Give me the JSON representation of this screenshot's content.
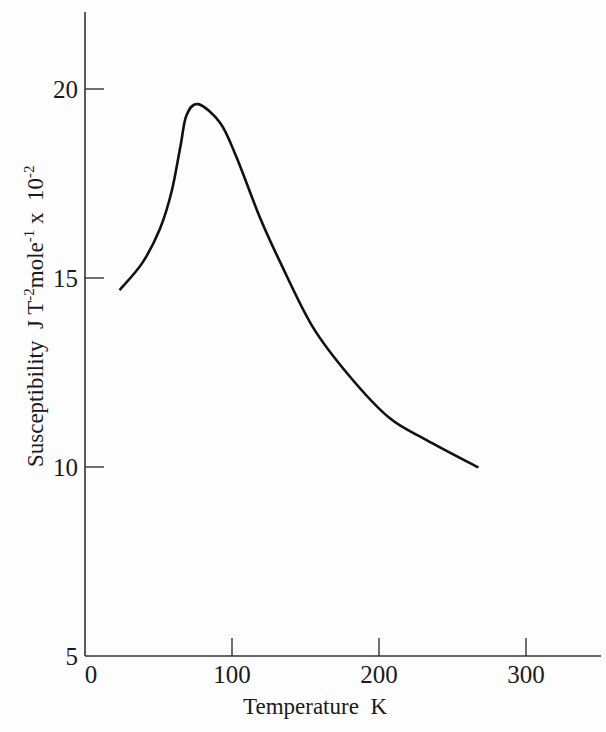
{
  "chart_data": {
    "type": "line",
    "title": "",
    "xlabel": "Temperature  K",
    "ylabel": "Susceptibility  J T⁻²mole⁻¹ x  10⁻²",
    "ylabel_parts": {
      "main": "Susceptibility  J T",
      "sup1": "-2",
      "mid": "mole",
      "sup2": "-1",
      "tail": " x  10",
      "sup3": "-2"
    },
    "xlim": [
      0,
      350
    ],
    "ylim": [
      5,
      22
    ],
    "xticks": [
      0,
      100,
      200,
      300
    ],
    "xtick_labels": [
      "0",
      "100",
      "200",
      "300"
    ],
    "yticks": [
      5,
      10,
      15,
      20
    ],
    "ytick_labels": [
      "5",
      "10",
      "15",
      "20"
    ],
    "grid": false,
    "legend": null,
    "series": [
      {
        "name": "Susceptibility",
        "x": [
          24,
          39,
          51,
          59,
          65,
          69,
          77,
          92,
          103,
          119,
          133,
          155,
          180,
          207,
          233,
          267
        ],
        "y": [
          14.7,
          15.4,
          16.3,
          17.3,
          18.5,
          19.3,
          19.6,
          19.1,
          18.2,
          16.6,
          15.4,
          13.7,
          12.4,
          11.3,
          10.7,
          10.0
        ]
      }
    ]
  }
}
